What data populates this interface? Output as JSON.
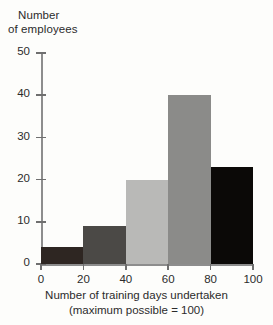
{
  "chart_data": {
    "type": "bar",
    "subtype": "histogram",
    "title": "",
    "xlabel": "Number of training days undertaken",
    "xlabel_line2": "(maximum possible = 100)",
    "ylabel": "Number",
    "ylabel_line2": "of employees",
    "categories": [
      "0-20",
      "20-40",
      "40-60",
      "60-80",
      "80-100"
    ],
    "bin_edges": [
      0,
      20,
      40,
      60,
      80,
      100
    ],
    "values": [
      4,
      9,
      20,
      40,
      23
    ],
    "bar_colors": [
      "#2e2622",
      "#4b4946",
      "#b9b9b7",
      "#8b8b89",
      "#0b0907"
    ],
    "xlim": [
      0,
      100
    ],
    "ylim": [
      0,
      50
    ],
    "xticks": [
      0,
      20,
      40,
      60,
      80,
      100
    ],
    "yticks": [
      0,
      10,
      20,
      30,
      40,
      50
    ],
    "xtick_labels": [
      "0",
      "20",
      "40",
      "60",
      "80",
      "100"
    ],
    "ytick_labels": [
      "0",
      "10",
      "20",
      "30",
      "40",
      "50"
    ],
    "grid": false,
    "legend": false,
    "axis_color": "#8d8d8d",
    "background": "#fdfdfb"
  }
}
